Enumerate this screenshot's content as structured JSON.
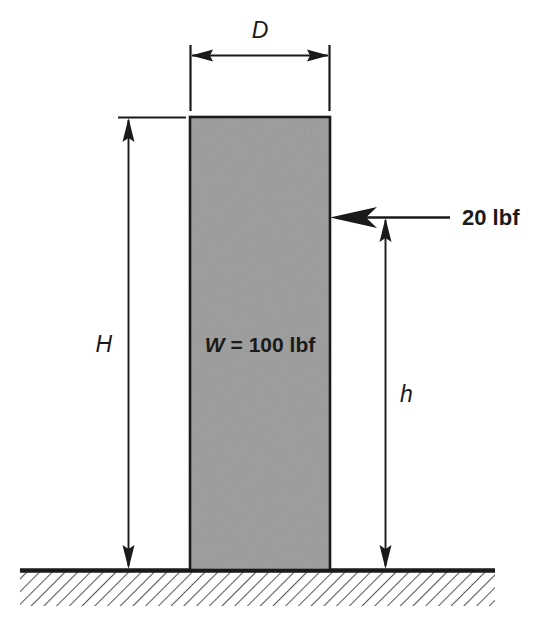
{
  "figure": {
    "kind": "free-body-diagram",
    "background_color": "#ffffff",
    "line_color": "#1a1a1a"
  },
  "block": {
    "name": "rectangular-block",
    "fill_color": "#9a9a9a",
    "stroke_color": "#1a1a1a",
    "x": 190,
    "y": 117,
    "width": 140,
    "height": 453,
    "weight_label": "W = 100 lbf",
    "weight_symbol": "W",
    "weight_value": "= 100 lbf"
  },
  "dimensions": {
    "width_dim": {
      "label": "D",
      "orientation": "horizontal",
      "y": 55,
      "x_start": 190,
      "x_end": 330,
      "extension_top": 45,
      "extension_bottom": 110
    },
    "total_height_dim": {
      "label": "H",
      "orientation": "vertical",
      "x": 128,
      "y_top": 117,
      "y_bottom": 570,
      "extension_line_x_start": 118,
      "extension_line_x_end": 185
    },
    "force_height_dim": {
      "label": "h",
      "orientation": "vertical",
      "x": 385,
      "y_top": 217,
      "y_bottom": 570
    }
  },
  "force": {
    "name": "applied-horizontal-force",
    "label": "20 lbf",
    "magnitude": 20,
    "unit": "lbf",
    "direction": "left",
    "y": 217,
    "tail_x": 450,
    "tip_x": 330,
    "label_x": 462
  },
  "ground": {
    "name": "ground-surface",
    "line_y": 570,
    "x_start": 20,
    "x_end": 495,
    "hatch_depth": 35,
    "hatch_angle_deg": 45,
    "hatch_color": "#5a5a5a",
    "surface_color": "#1a1a1a"
  }
}
